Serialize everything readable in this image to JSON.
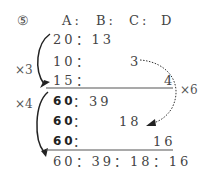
{
  "problem_number": "⑤",
  "headers": {
    "A": "A",
    "B": "B",
    "C": "C",
    "D": "D",
    "sep": ":"
  },
  "rows": [
    {
      "text": "20：13"
    },
    {
      "a": "10：",
      "c": "3"
    },
    {
      "a": "15：",
      "d": "4"
    },
    {
      "a": "60",
      "rest": "：39"
    },
    {
      "a": "60",
      "rest": "：",
      "c": "18"
    },
    {
      "a": "60",
      "rest": "：",
      "d": "16"
    }
  ],
  "result": "60：39：18：16",
  "multipliers": {
    "x3": "×3",
    "x4": "×4",
    "x6": "×6"
  }
}
